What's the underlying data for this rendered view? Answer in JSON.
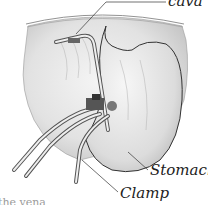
{
  "figure": {
    "type": "anatomical-illustration",
    "style": "grayscale-pencil",
    "labels": {
      "cava": "cava",
      "stomach": "Stomach",
      "clamp": "Clamp"
    },
    "caption_fragment": "the vena"
  },
  "colors": {
    "background": "#ffffff",
    "ink": "#222222",
    "shade_light": "#e6e6e6",
    "shade_mid": "#c8c8c8",
    "shade_dark": "#8a8a8a"
  }
}
